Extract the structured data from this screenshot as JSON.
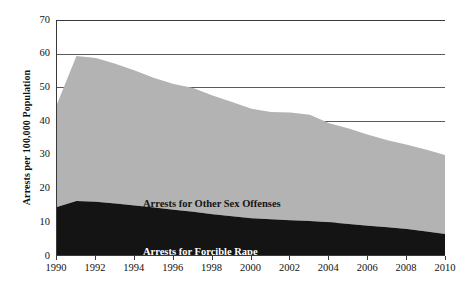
{
  "chart_data": {
    "type": "area",
    "stacked": true,
    "title": "",
    "xlabel": "",
    "ylabel": "Arrests per 100,000 Population",
    "xlim": [
      1990,
      2010
    ],
    "ylim": [
      0,
      70
    ],
    "y_ticks": [
      0,
      10,
      20,
      30,
      40,
      50,
      60,
      70
    ],
    "x_ticks": [
      1990,
      1992,
      1994,
      1996,
      1998,
      2000,
      2002,
      2004,
      2006,
      2008,
      2010
    ],
    "x": [
      1990,
      1991,
      1992,
      1993,
      1994,
      1995,
      1996,
      1997,
      1998,
      1999,
      2000,
      2001,
      2002,
      2003,
      2004,
      2005,
      2006,
      2007,
      2008,
      2009,
      2010
    ],
    "grid": "horizontal",
    "legend_position": "in-plot-annotations",
    "series": [
      {
        "name": "Arrests for Forcible Rape",
        "color": "#141414",
        "values": [
          14.5,
          16.3,
          16.1,
          15.6,
          15.0,
          14.4,
          13.7,
          13.1,
          12.4,
          11.8,
          11.2,
          10.9,
          10.6,
          10.4,
          10.0,
          9.5,
          9.0,
          8.5,
          8.0,
          7.3,
          6.5
        ]
      },
      {
        "name": "Arrests for Other Sex Offenses",
        "color": "#b3b3b3",
        "values": [
          30.6,
          43.0,
          42.6,
          41.4,
          40.0,
          38.4,
          37.3,
          36.7,
          35.2,
          33.9,
          32.5,
          31.8,
          32.0,
          31.5,
          29.4,
          28.3,
          27.0,
          25.8,
          25.0,
          24.2,
          23.4
        ]
      }
    ],
    "totals": [
      45.1,
      59.3,
      58.7,
      57.0,
      55.0,
      52.8,
      51.0,
      49.8,
      47.6,
      45.7,
      43.7,
      42.7,
      42.6,
      41.9,
      39.4,
      37.8,
      36.0,
      34.3,
      33.0,
      31.5,
      29.9
    ],
    "annotations": [
      {
        "text": "Arrests for Other Sex Offenses",
        "series": "Arrests for Other Sex Offenses"
      },
      {
        "text": "Arrests for Forcible Rape",
        "series": "Arrests for Forcible Rape"
      }
    ],
    "colors": {
      "other_sex_offenses": "#b3b3b3",
      "forcible_rape": "#141414",
      "axis": "#3a3a3a",
      "gridline": "#5a5a5a",
      "background": "#ffffff"
    }
  }
}
